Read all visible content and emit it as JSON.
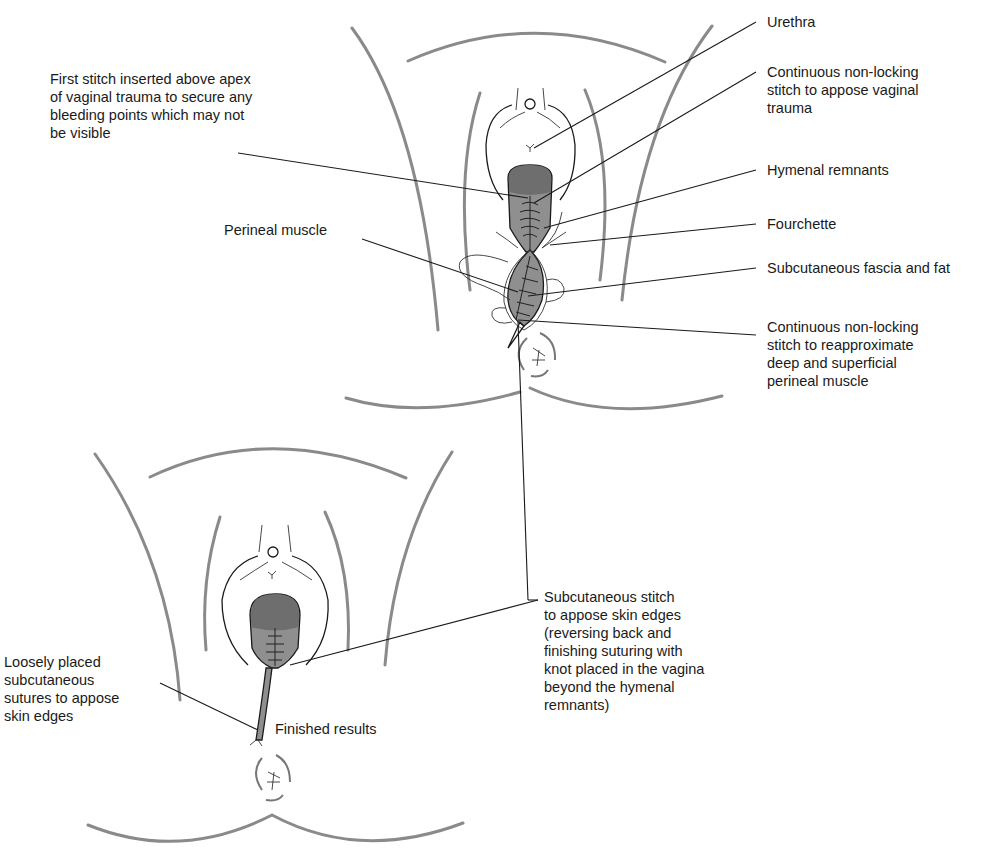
{
  "figure": {
    "top_panel": {
      "labels": {
        "first_stitch": "First stitch inserted above apex\nof vaginal trauma to secure any\nbleeding points which may not\nbe visible",
        "perineal_muscle": "Perineal muscle",
        "urethra": "Urethra",
        "continuous_vaginal": "Continuous non-locking\nstitch to appose vaginal\ntrauma",
        "hymenal_remnants": "Hymenal remnants",
        "fourchette": "Fourchette",
        "subcutaneous_fascia": "Subcutaneous fascia and fat",
        "continuous_perineal": "Continuous non-locking\nstitch to reapproximate\ndeep and superficial\nperineal muscle"
      }
    },
    "bottom_panel": {
      "labels": {
        "loosely_placed": "Loosely placed\nsubcutaneous\nsutures to appose\nskin edges",
        "finished_results": "Finished results",
        "subcutaneous_stitch": "Subcutaneous stitch\nto appose skin edges\n(reversing back and\nfinishing suturing with\nknot placed in the vagina\nbeyond the hymenal\nremnants)"
      }
    },
    "colors": {
      "ink": "#1a1a1a",
      "contour": "#8a8a8a",
      "tissue": "#8f8f8f",
      "tissue_dark": "#6e6e6e",
      "background": "#ffffff"
    }
  }
}
